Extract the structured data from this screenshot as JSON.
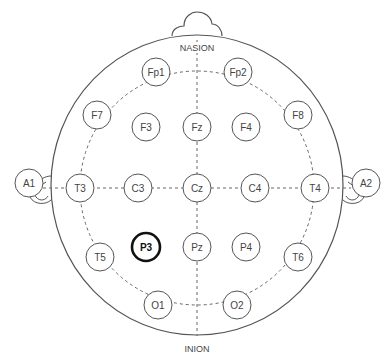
{
  "diagram": {
    "landmarks": {
      "top": "NASION",
      "bottom": "INION"
    },
    "selected_electrode": "P3",
    "electrodes": [
      {
        "id": "Fp1",
        "x": 156,
        "y": 72
      },
      {
        "id": "Fp2",
        "x": 238,
        "y": 72
      },
      {
        "id": "F7",
        "x": 97,
        "y": 115
      },
      {
        "id": "F3",
        "x": 146,
        "y": 127
      },
      {
        "id": "Fz",
        "x": 197,
        "y": 127
      },
      {
        "id": "F4",
        "x": 246,
        "y": 127
      },
      {
        "id": "F8",
        "x": 298,
        "y": 115
      },
      {
        "id": "A1",
        "x": 29,
        "y": 183
      },
      {
        "id": "T3",
        "x": 80,
        "y": 188
      },
      {
        "id": "C3",
        "x": 138,
        "y": 188
      },
      {
        "id": "Cz",
        "x": 197,
        "y": 188
      },
      {
        "id": "C4",
        "x": 255,
        "y": 188
      },
      {
        "id": "T4",
        "x": 315,
        "y": 188
      },
      {
        "id": "A2",
        "x": 366,
        "y": 183
      },
      {
        "id": "T5",
        "x": 100,
        "y": 257
      },
      {
        "id": "P3",
        "x": 146,
        "y": 247
      },
      {
        "id": "Pz",
        "x": 197,
        "y": 247
      },
      {
        "id": "P4",
        "x": 246,
        "y": 247
      },
      {
        "id": "T6",
        "x": 298,
        "y": 257
      },
      {
        "id": "O1",
        "x": 158,
        "y": 305
      },
      {
        "id": "O2",
        "x": 237,
        "y": 305
      }
    ],
    "colors": {
      "outline": "#555555",
      "selected_outline": "#111111",
      "background": "#ffffff"
    }
  }
}
